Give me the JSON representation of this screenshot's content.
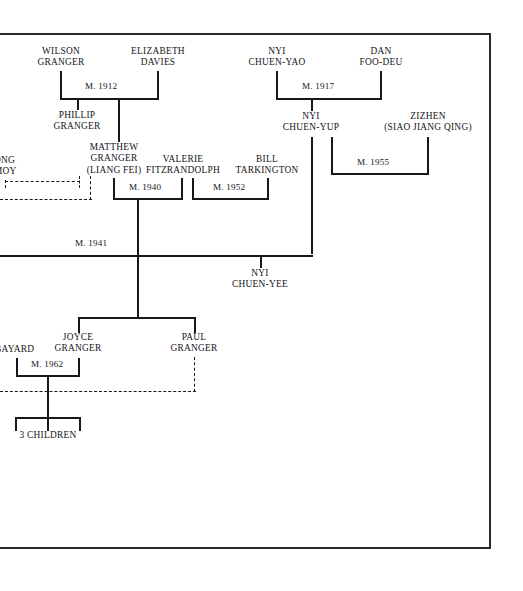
{
  "document": {
    "type": "genealogy-family-tree-chart",
    "border_color": "#2a2a2c",
    "line_color": "#18181a",
    "background": "#ffffff"
  },
  "people": {
    "wilson_granger": {
      "line1": "WILSON",
      "line2": "GRANGER"
    },
    "elizabeth_davies": {
      "line1": "ELIZABETH",
      "line2": "DAVIES"
    },
    "nyi_chuen_yao": {
      "line1": "NYI",
      "line2": "CHUEN-YAO"
    },
    "dan_foo_deu": {
      "line1": "DAN",
      "line2": "FOO-DEU"
    },
    "phillip_granger": {
      "line1": "PHILLIP",
      "line2": "GRANGER"
    },
    "nyi_chuen_yup": {
      "line1": "NYI",
      "line2": "CHUEN-YUP"
    },
    "zizhen": {
      "line1": "ZIZHEN",
      "line2": "(SIAO JIANG QING)"
    },
    "wong_moy": {
      "line1": "ONG",
      "line2": "MOY"
    },
    "matthew_granger": {
      "line1": "MATTHEW",
      "line2": "GRANGER",
      "line3": "(LIANG FEI)"
    },
    "valerie_fitzrandolph": {
      "line1": "VALERIE",
      "line2": "FITZRANDOLPH"
    },
    "bill_tarkington": {
      "line1": "BILL",
      "line2": "TARKINGTON"
    },
    "nyi_chuen_yee": {
      "line1": "NYI",
      "line2": "CHUEN-YEE"
    },
    "bayard": {
      "line1": "BAYARD"
    },
    "joyce_granger": {
      "line1": "JOYCE",
      "line2": "GRANGER"
    },
    "paul_granger": {
      "line1": "PAUL",
      "line2": "GRANGER"
    },
    "three_children": {
      "line1": "3 CHILDREN"
    }
  },
  "marriages": {
    "m1912": "M. 1912",
    "m1917": "M. 1917",
    "m1940": "M. 1940",
    "m1952": "M. 1952",
    "m1955": "M. 1955",
    "m1941": "M. 1941",
    "m1962": "M. 1962"
  }
}
